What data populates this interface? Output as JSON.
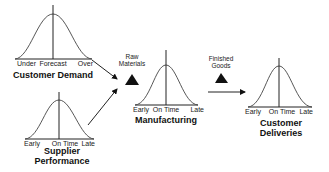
{
  "diagram": {
    "nodes": [
      {
        "id": "customer-demand",
        "title_lines": [
          "Customer Demand"
        ],
        "axis_labels": [
          "Under",
          "Forecast",
          "Over"
        ]
      },
      {
        "id": "supplier-performance",
        "title_lines": [
          "Supplier",
          "Performance"
        ],
        "axis_labels": [
          "Early",
          "On Time",
          "Late"
        ]
      },
      {
        "id": "manufacturing",
        "title_lines": [
          "Manufacturing"
        ],
        "axis_labels": [
          "Early",
          "On Time",
          "Late"
        ]
      },
      {
        "id": "customer-deliveries",
        "title_lines": [
          "Customer",
          "Deliveries"
        ],
        "axis_labels": [
          "Early",
          "On Time",
          "Late"
        ]
      }
    ],
    "inventories": [
      {
        "id": "raw-materials",
        "label_lines": [
          "Raw",
          "Materials"
        ]
      },
      {
        "id": "finished-goods",
        "label_lines": [
          "Finished",
          "Goods"
        ]
      }
    ],
    "edges": [
      {
        "from": "customer-demand",
        "to": "manufacturing"
      },
      {
        "from": "supplier-performance",
        "to": "manufacturing"
      },
      {
        "from": "manufacturing",
        "to": "customer-deliveries"
      }
    ]
  }
}
